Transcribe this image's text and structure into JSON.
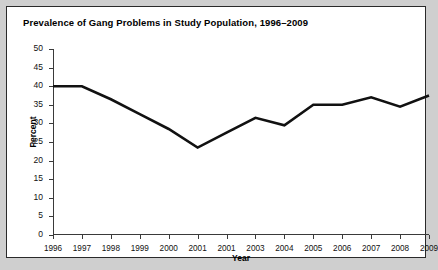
{
  "figure": {
    "title": "Prevalence of Gang Problems in Study Population, 1996–2009",
    "background_color": "#ffffff",
    "border_color": "#2a2a2a",
    "outer_background_color": "#cfcfcf"
  },
  "chart_data": {
    "type": "line",
    "title": "Prevalence of Gang Problems in Study Population, 1996–2009",
    "xlabel": "Year",
    "ylabel": "Percent",
    "categories": [
      "1996",
      "1997",
      "1998",
      "1999",
      "2000",
      "2001",
      "2001",
      "2003",
      "2004",
      "2005",
      "2006",
      "2007",
      "2008",
      "2009"
    ],
    "values": [
      40,
      40,
      36.5,
      32.5,
      28.5,
      23.5,
      27.5,
      31.5,
      29.5,
      35,
      35,
      37,
      34.5,
      37.5
    ],
    "ylim": [
      0,
      50
    ],
    "ytick_values": [
      0,
      5,
      10,
      15,
      20,
      25,
      30,
      35,
      40,
      45,
      50
    ],
    "ytick_labels": [
      "0",
      "5",
      "10",
      "15",
      "20",
      "25",
      "30",
      "35",
      "40",
      "45",
      "50"
    ],
    "grid": false,
    "legend": false,
    "line_color": "#111111",
    "line_width": 2.6,
    "markers": false,
    "note": "Seventh x-axis tick label reads 2001, duplicating the sixth label, as printed in the source chart."
  }
}
